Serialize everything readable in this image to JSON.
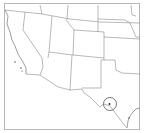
{
  "map": {
    "region": "Southwestern United States",
    "states_visible": [
      "California",
      "Nevada",
      "Oregon",
      "Idaho",
      "Utah",
      "Arizona",
      "Wyoming",
      "Colorado",
      "New Mexico",
      "Nebraska",
      "Kansas",
      "Oklahoma",
      "Texas"
    ],
    "highlight": {
      "shape": "circle",
      "location": "Big Bend, Texas",
      "color": "#555555"
    },
    "colors": {
      "background": "#ffffff",
      "borders": "#8a8a8a",
      "frame": "#b8b8b8"
    }
  }
}
